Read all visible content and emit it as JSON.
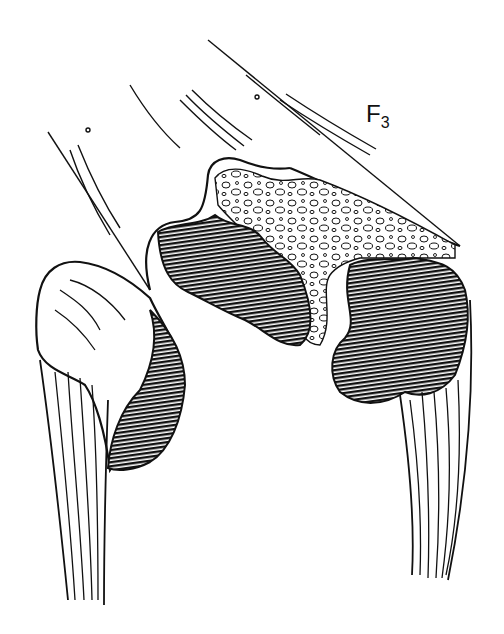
{
  "figure": {
    "label_main": "F",
    "label_sub": "3",
    "colors": {
      "ink": "#111111",
      "paper": "#ffffff"
    }
  }
}
